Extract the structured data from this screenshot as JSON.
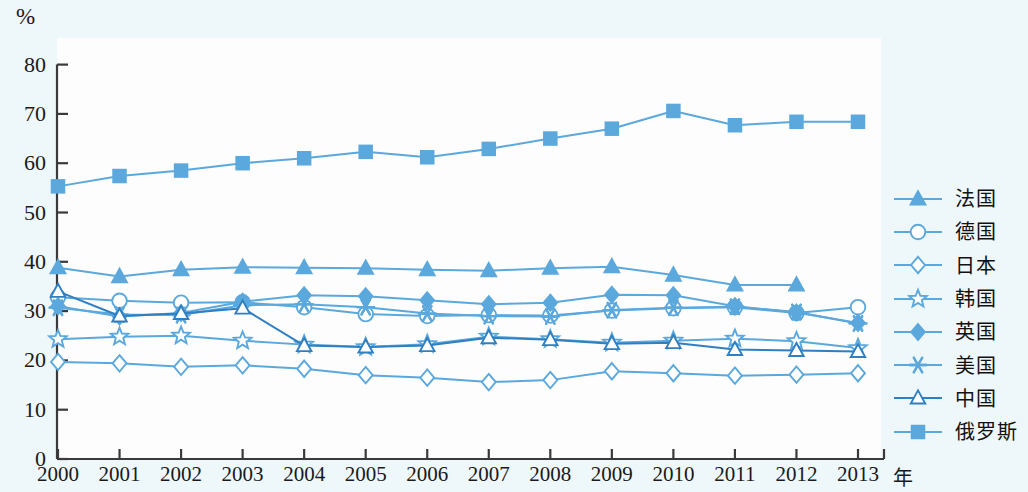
{
  "axes": {
    "y_unit_label": "%",
    "x_axis_title": "年",
    "yticks": [
      "0",
      "10",
      "20",
      "30",
      "40",
      "50",
      "60",
      "70",
      "80"
    ],
    "xticks": [
      "2000",
      "2001",
      "2002",
      "2003",
      "2004",
      "2005",
      "2006",
      "2007",
      "2008",
      "2009",
      "2010",
      "2011",
      "2012",
      "2013"
    ]
  },
  "legend": {
    "items": [
      {
        "label": "法国",
        "marker": "triangle-filled",
        "color": "#5ba8dd"
      },
      {
        "label": "德国",
        "marker": "circle-open",
        "color": "#5ba8dd"
      },
      {
        "label": "日本",
        "marker": "diamond-open",
        "color": "#5ba8dd"
      },
      {
        "label": "韩国",
        "marker": "star-open",
        "color": "#5ba8dd"
      },
      {
        "label": "英国",
        "marker": "diamond-filled",
        "color": "#5ba8dd"
      },
      {
        "label": "美国",
        "marker": "asterisk",
        "color": "#5ba8dd"
      },
      {
        "label": "中国",
        "marker": "triangle-open",
        "color": "#2f7fc1"
      },
      {
        "label": "俄罗斯",
        "marker": "square-filled",
        "color": "#5ba8dd"
      }
    ]
  },
  "colors": {
    "line": "#5ba8dd",
    "line_dark": "#2f7fc1",
    "axis": "#3a3a3a",
    "panel": "#fdfdfd",
    "figure_bg": "#eef7fa"
  },
  "chart_data": {
    "type": "line",
    "title": "",
    "xlabel": "年",
    "ylabel": "%",
    "ylim": [
      0,
      80
    ],
    "ytick_step": 10,
    "grid": false,
    "legend_position": "right",
    "x": [
      2000,
      2001,
      2002,
      2003,
      2004,
      2005,
      2006,
      2007,
      2008,
      2009,
      2010,
      2011,
      2012,
      2013
    ],
    "series": [
      {
        "name": "法国",
        "marker": "triangle-filled",
        "values": [
          38.8,
          37.0,
          38.4,
          38.9,
          38.8,
          38.7,
          38.4,
          38.2,
          38.7,
          39.0,
          37.3,
          35.3,
          35.3,
          null
        ]
      },
      {
        "name": "德国",
        "marker": "circle-open",
        "values": [
          32.8,
          32.1,
          31.7,
          31.8,
          30.8,
          29.4,
          29.0,
          29.2,
          29.1,
          30.1,
          30.6,
          30.8,
          29.6,
          30.8
        ]
      },
      {
        "name": "日本",
        "marker": "diamond-open",
        "values": [
          19.7,
          19.4,
          18.7,
          19.0,
          18.3,
          17.0,
          16.5,
          15.6,
          16.0,
          17.8,
          17.4,
          16.9,
          17.1,
          17.4
        ]
      },
      {
        "name": "韩国",
        "marker": "star-open",
        "values": [
          24.3,
          24.8,
          25.0,
          24.0,
          23.2,
          22.7,
          23.3,
          24.8,
          24.3,
          23.6,
          24.0,
          24.4,
          23.9,
          22.5
        ]
      },
      {
        "name": "英国",
        "marker": "diamond-filled",
        "values": [
          31.0,
          28.9,
          29.6,
          31.9,
          33.2,
          33.0,
          32.2,
          31.4,
          31.7,
          33.3,
          33.2,
          31.0,
          29.7,
          27.6
        ]
      },
      {
        "name": "美国",
        "marker": "asterisk",
        "values": [
          30.7,
          29.3,
          29.2,
          31.2,
          31.4,
          30.8,
          29.5,
          29.0,
          28.9,
          30.2,
          30.7,
          30.9,
          29.8,
          27.5
        ]
      },
      {
        "name": "中国",
        "marker": "triangle-open",
        "values": [
          34.0,
          29.0,
          29.5,
          30.6,
          23.0,
          22.7,
          23.0,
          24.6,
          24.2,
          23.4,
          23.6,
          22.2,
          22.0,
          21.8
        ]
      },
      {
        "name": "俄罗斯",
        "marker": "square-filled",
        "values": [
          55.3,
          57.4,
          58.5,
          60.0,
          61.0,
          62.3,
          61.2,
          62.9,
          65.0,
          67.0,
          70.6,
          67.7,
          68.4,
          68.4
        ]
      }
    ]
  }
}
